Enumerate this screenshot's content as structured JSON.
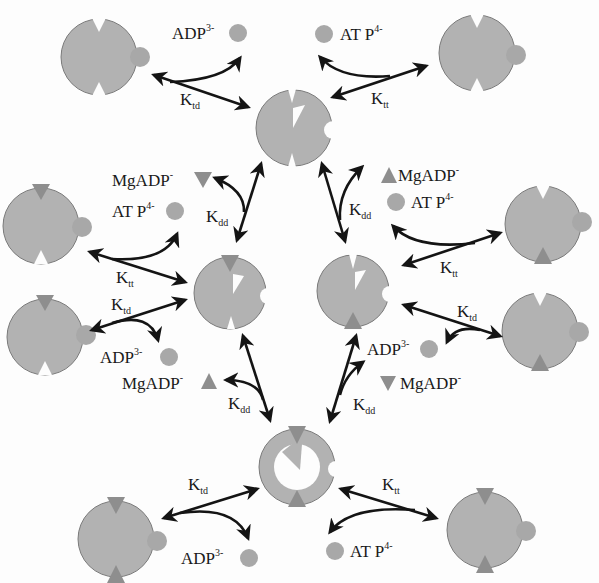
{
  "diagram": {
    "colors": {
      "protein_fill": "#b2b2b2",
      "protein_stroke": "#7a7a7a",
      "ligand_circle": "#a8a8a8",
      "mgadp_triangle": "#8e8e8e",
      "arrow": "#141414",
      "text": "#1a1a1a",
      "background": "#fdfdfd"
    },
    "species_labels": {
      "adp": {
        "base": "ADP",
        "charge": "3-"
      },
      "atp": {
        "base": "AT P",
        "charge": "4-"
      },
      "mgadp": {
        "base": "MgADP",
        "charge": "-"
      }
    },
    "rate_constants": {
      "ktd": {
        "base": "K",
        "sub": "td"
      },
      "ktt": {
        "base": "K",
        "sub": "tt"
      },
      "kdd": {
        "base": "K",
        "sub": "dd"
      }
    },
    "labels": [
      {
        "id": "top-left-adp",
        "species": "ADP",
        "charge": "3-"
      },
      {
        "id": "top-right-atp",
        "species": "AT P",
        "charge": "4-"
      },
      {
        "id": "mid-left-mgadp",
        "species": "MgADP",
        "charge": "-"
      },
      {
        "id": "mid-left-atp",
        "species": "AT P",
        "charge": "4-"
      },
      {
        "id": "mid-right-mgadp",
        "species": "MgADP",
        "charge": "-"
      },
      {
        "id": "mid-right-atp",
        "species": "AT P",
        "charge": "4-"
      },
      {
        "id": "lower-left-adp",
        "species": "ADP",
        "charge": "3-"
      },
      {
        "id": "lower-left-mgadp",
        "species": "MgADP",
        "charge": "-"
      },
      {
        "id": "lower-right-adp",
        "species": "ADP",
        "charge": "3-"
      },
      {
        "id": "lower-right-mgadp",
        "species": "MgADP",
        "charge": "-"
      },
      {
        "id": "bottom-left-adp",
        "species": "ADP",
        "charge": "3-"
      },
      {
        "id": "bottom-right-atp",
        "species": "AT P",
        "charge": "4-"
      }
    ],
    "k_labels": [
      {
        "id": "top-left",
        "base": "K",
        "sub": "td"
      },
      {
        "id": "top-right",
        "base": "K",
        "sub": "tt"
      },
      {
        "id": "upper-left",
        "base": "K",
        "sub": "dd"
      },
      {
        "id": "upper-right",
        "base": "K",
        "sub": "dd"
      },
      {
        "id": "mid-left-tt",
        "base": "K",
        "sub": "tt"
      },
      {
        "id": "mid-left-td",
        "base": "K",
        "sub": "td"
      },
      {
        "id": "mid-right-tt",
        "base": "K",
        "sub": "tt"
      },
      {
        "id": "mid-right-td",
        "base": "K",
        "sub": "td"
      },
      {
        "id": "lower-left-dd",
        "base": "K",
        "sub": "dd"
      },
      {
        "id": "lower-right-dd",
        "base": "K",
        "sub": "dd"
      },
      {
        "id": "bottom-left-td",
        "base": "K",
        "sub": "td"
      },
      {
        "id": "bottom-right-tt",
        "base": "K",
        "sub": "tt"
      }
    ]
  }
}
